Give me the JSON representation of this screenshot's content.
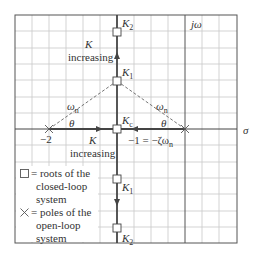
{
  "diagram": {
    "type": "root-locus",
    "axes": {
      "real_axis_label": "σ",
      "imag_axis_label": "jω"
    },
    "points": {
      "K2_top": "K2",
      "K1_top": "K1",
      "Kc": "Kc",
      "K1_bottom": "K1",
      "K2_bottom": "K2"
    },
    "real_axis_ticks": {
      "left_pole": "−2",
      "breakaway": "−1 = −ζω",
      "breakaway_sub": "n"
    },
    "annotations": {
      "k_upper": "K",
      "increasing_upper": "increasing",
      "k_lower": "K",
      "increasing_lower": "increasing",
      "omega_left": "ω",
      "omega_right": "ω",
      "omega_sub": "n",
      "theta_left": "θ",
      "theta_right": "θ"
    },
    "legend": {
      "square_symbol": "□",
      "cross_symbol": "×",
      "square_lines": [
        "= roots of the",
        "closed-loop",
        "system"
      ],
      "cross_lines": [
        "= poles of the",
        "open-loop",
        "system"
      ]
    },
    "colors": {
      "grid": "#c8c8c8",
      "axis": "#444444",
      "locus": "#555555",
      "dashed": "#666666"
    }
  }
}
